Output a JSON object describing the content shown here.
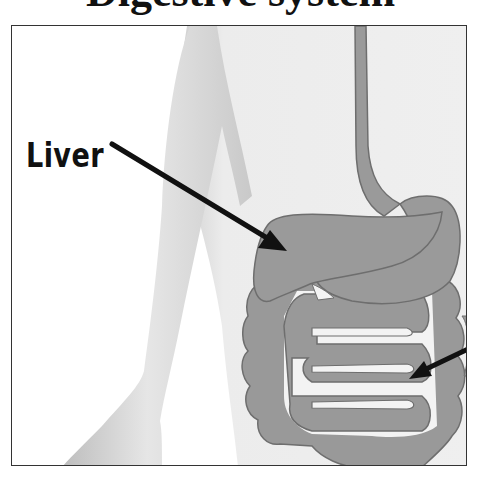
{
  "title": {
    "text": "Digestive system",
    "visible_fragment": "p g"
  },
  "diagram": {
    "labels": [
      {
        "id": "liver",
        "text": "Liver"
      }
    ],
    "organs": [
      "body-silhouette",
      "arm",
      "esophagus",
      "liver",
      "stomach",
      "large-intestine",
      "small-intestine"
    ],
    "colors": {
      "organ_fill": "#9a9a9a",
      "organ_outline": "#6e6e6e",
      "body_fill": "#e9e9e9",
      "arm_shade": "#c8c8c8",
      "arrow": "#111111",
      "frame": "#333333"
    }
  }
}
